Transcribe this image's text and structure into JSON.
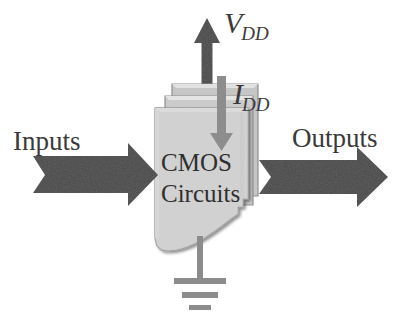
{
  "figure": {
    "type": "block-diagram",
    "canvas": {
      "width": 398,
      "height": 328,
      "background": "#ffffff"
    }
  },
  "labels": {
    "inputs": "Inputs",
    "outputs": "Outputs",
    "block_line1": "CMOS",
    "block_line2": "Circuits",
    "supply_voltage_base": "V",
    "supply_voltage_sub": "DD",
    "supply_current_base": "I",
    "supply_current_sub": "DD"
  },
  "elements": {
    "input_arrow": {
      "name": "Inputs arrow",
      "direction": "right",
      "color": "#4a4a4a"
    },
    "output_arrow": {
      "name": "Outputs arrow",
      "direction": "right",
      "color": "#4a4a4a"
    },
    "vdd_arrow": {
      "name": "V_DD supply arrow",
      "direction": "up",
      "color": "#4a4a4a"
    },
    "idd_arrow": {
      "name": "I_DD current arrow",
      "direction": "down",
      "color": "#8a8a8a"
    },
    "sheet_stack": {
      "name": "CMOS circuits sheet stack",
      "sheets": 3,
      "fill": "#d2d2d2",
      "back_fill": "#c6c6c6",
      "edge": "#9a9a9a"
    },
    "ground_symbol": {
      "name": "ground symbol",
      "bars": 3,
      "color": "#8c8c8c"
    }
  },
  "colors": {
    "arrow_dark": "#4a4a4a",
    "arrow_mid": "#8a8a8a",
    "sheet_fill": "#d2d2d2",
    "sheet_back": "#c6c6c6",
    "sheet_edge": "#9a9a9a",
    "text": "#3a3a3a",
    "ground": "#8c8c8c",
    "background": "#ffffff"
  }
}
